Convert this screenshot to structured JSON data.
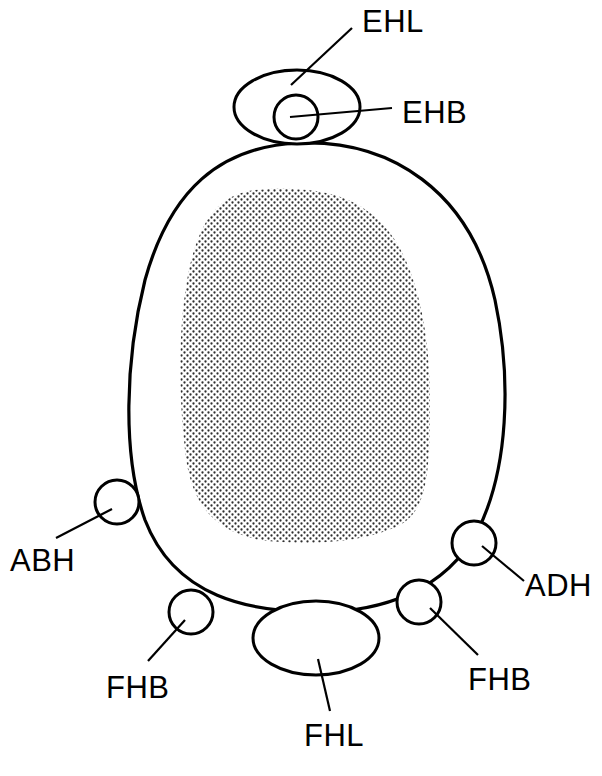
{
  "diagram": {
    "type": "anatomical cross-section schematic",
    "colors": {
      "line": "#000000",
      "background": "#ffffff",
      "stipple": "#3a3a3a"
    },
    "regions": {
      "body": "outer-outline",
      "shaded_core": "stippled-region"
    },
    "labels": {
      "ehl": "EHL",
      "ehb": "EHB",
      "abh": "ABH",
      "adh": "ADH",
      "fhb_left": "FHB",
      "fhb_right": "FHB",
      "fhl": "FHL"
    }
  }
}
